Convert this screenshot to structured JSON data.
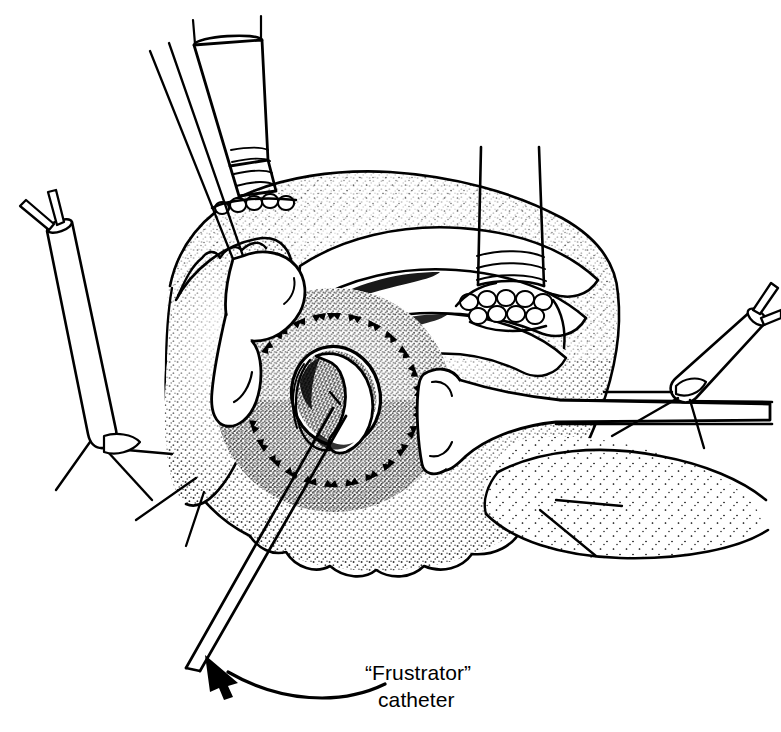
{
  "figure": {
    "kind": "surgical-line-illustration",
    "background_color": "#ffffff",
    "ink_color": "#000000",
    "width": 781,
    "height": 732
  },
  "annotation": {
    "label_line_1": "“Frustrator”",
    "label_line_2": "catheter",
    "arrow": {
      "name": "curved-leader-arrow",
      "points_to": "catheter-shaft-lower-left",
      "style": "curved-with-solid-head"
    }
  },
  "structures": {
    "tissue_mass": {
      "name": "retracted-tissue-field",
      "texture": "stipple",
      "shading": "variable-density-dot-shading"
    },
    "valve_orifice": {
      "name": "valve-orifice",
      "description": "central open annulus with everted rim"
    },
    "suture_ring": {
      "name": "annular-suture-ring",
      "description": "ring of dashed suture stitch marks encircling the orifice",
      "stitch_count": 26
    },
    "tissue_flaps": {
      "name": "retracted-atrial-wall-flaps",
      "count": 3
    },
    "stay_sutures": {
      "name": "stay-suture-traction-stitches",
      "count": 4
    }
  },
  "instruments": [
    {
      "id": "cannula-superior",
      "name": "superior-venous-cannula",
      "position": "top-left-center",
      "features": "ribbed-band-section, purse-string-pledget-row, open-tube-end"
    },
    {
      "id": "cannula-right",
      "name": "right-venous-cannula",
      "position": "top-right",
      "features": "ribbed-band-section, purse-string-pledget-row"
    },
    {
      "id": "retractor-left",
      "name": "left-retractor-blade",
      "position": "upper-left",
      "features": "paddle-blade, two-thin-handle-shafts"
    },
    {
      "id": "retractor-right",
      "name": "right-retractor-blade",
      "position": "right-center",
      "features": "paddle-blade, horizontal-shaft"
    },
    {
      "id": "snare-left",
      "name": "left-tourniquet-snare",
      "position": "left",
      "features": "tube-with-two-suture-tails"
    },
    {
      "id": "snare-right",
      "name": "right-tourniquet-snare",
      "position": "right",
      "features": "tube-with-two-suture-tails"
    },
    {
      "id": "frustrator-catheter",
      "name": "frustrator-catheter",
      "position": "through-valve-orifice-exiting-lower-left",
      "features": "straight-twin-line-tube"
    }
  ]
}
